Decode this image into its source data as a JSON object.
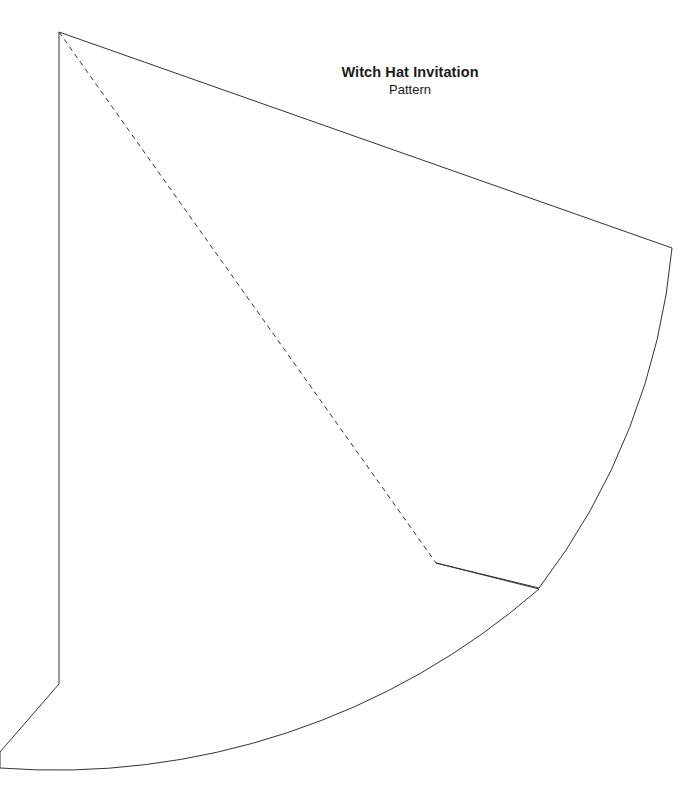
{
  "document": {
    "title": "Witch Hat Invitation",
    "subtitle": "Pattern",
    "background_color": "#ffffff",
    "line_color": "#333333"
  },
  "pattern": {
    "name": "witch-hat-cone-pattern",
    "apex": {
      "x": 59,
      "y": 32
    },
    "stroke_width": 1,
    "stroke_color": "#333333",
    "fill_color": "none",
    "fold_line": {
      "name": "fold-line",
      "style": "dashed",
      "dash_length": 5,
      "gap_length": 4,
      "from": {
        "x": 59,
        "y": 32
      },
      "to": {
        "x": 436,
        "y": 563
      }
    },
    "outline_path": "M 59 32 L 672 248 A 655 655 0 0 1 539 588 L 436 563 L 539 589 A 735 735 0 0 1 0 768 L 0 752 L 59 684 Z",
    "vertices": [
      {
        "name": "apex",
        "x": 59,
        "y": 32
      },
      {
        "name": "top-right-corner",
        "x": 672,
        "y": 248
      },
      {
        "name": "notch-outer-tip",
        "x": 539,
        "y": 588
      },
      {
        "name": "notch-inner-vertex",
        "x": 436,
        "y": 563
      },
      {
        "name": "left-edge-bottom",
        "x": 59,
        "y": 684
      },
      {
        "name": "left-margin-exit",
        "x": 0,
        "y": 752
      }
    ],
    "arcs": [
      {
        "name": "upper-outer-arc",
        "radius": 655,
        "from": {
          "x": 672,
          "y": 248
        },
        "to": {
          "x": 539,
          "y": 588
        }
      },
      {
        "name": "lower-brim-arc",
        "radius": 735,
        "from": {
          "x": 539,
          "y": 589
        },
        "to": {
          "x": 0,
          "y": 768
        }
      }
    ]
  },
  "canvas": {
    "width": 700,
    "height": 796
  }
}
